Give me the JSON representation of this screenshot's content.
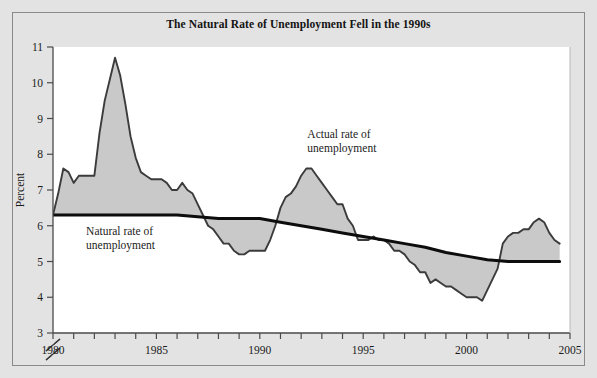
{
  "chart_data": {
    "type": "area",
    "title": "The Natural Rate of Unemployment Fell in the 1990s",
    "xlabel": "",
    "ylabel": "Percent",
    "xlim": [
      1980,
      2005
    ],
    "ylim": [
      3,
      11
    ],
    "y_axis_break": true,
    "grid": false,
    "legend_position": "inline-annotations",
    "x_ticks": [
      1980,
      1981,
      1982,
      1983,
      1984,
      1985,
      1986,
      1987,
      1988,
      1989,
      1990,
      1991,
      1992,
      1993,
      1994,
      1995,
      1996,
      1997,
      1998,
      1999,
      2000,
      2001,
      2002,
      2003,
      2004,
      2005
    ],
    "x_tick_labels": [
      "1980",
      "",
      "",
      "",
      "",
      "1985",
      "",
      "",
      "",
      "",
      "1990",
      "",
      "",
      "",
      "",
      "1995",
      "",
      "",
      "",
      "",
      "2000",
      "",
      "",
      "",
      "",
      "2005"
    ],
    "y_ticks": [
      3,
      4,
      5,
      6,
      7,
      8,
      9,
      10,
      11
    ],
    "y_tick_labels": [
      "3",
      "4",
      "5",
      "6",
      "7",
      "8",
      "9",
      "10",
      "11"
    ],
    "annotations": [
      {
        "name": "natural-rate-label",
        "text_line1": "Natural rate of",
        "text_line2": "unemployment",
        "x": 1981.6,
        "y": 5.75
      },
      {
        "name": "actual-rate-label",
        "text_line1": "Actual rate of",
        "text_line2": "unemployment",
        "x": 1992.3,
        "y": 8.45
      }
    ],
    "series": [
      {
        "name": "Actual rate of unemployment",
        "color": "#3b3b3b",
        "fill": "#c9c9c9",
        "x": [
          1980.0,
          1980.25,
          1980.5,
          1980.75,
          1981.0,
          1981.25,
          1981.5,
          1981.75,
          1982.0,
          1982.25,
          1982.5,
          1982.75,
          1983.0,
          1983.25,
          1983.5,
          1983.75,
          1984.0,
          1984.25,
          1984.5,
          1984.75,
          1985.0,
          1985.25,
          1985.5,
          1985.75,
          1986.0,
          1986.25,
          1986.5,
          1986.75,
          1987.0,
          1987.25,
          1987.5,
          1987.75,
          1988.0,
          1988.25,
          1988.5,
          1988.75,
          1989.0,
          1989.25,
          1989.5,
          1989.75,
          1990.0,
          1990.25,
          1990.5,
          1990.75,
          1991.0,
          1991.25,
          1991.5,
          1991.75,
          1992.0,
          1992.25,
          1992.5,
          1992.75,
          1993.0,
          1993.25,
          1993.5,
          1993.75,
          1994.0,
          1994.25,
          1994.5,
          1994.75,
          1995.0,
          1995.25,
          1995.5,
          1995.75,
          1996.0,
          1996.25,
          1996.5,
          1996.75,
          1997.0,
          1997.25,
          1997.5,
          1997.75,
          1998.0,
          1998.25,
          1998.5,
          1998.75,
          1999.0,
          1999.25,
          1999.5,
          1999.75,
          2000.0,
          2000.25,
          2000.5,
          2000.75,
          2001.0,
          2001.25,
          2001.5,
          2001.75,
          2002.0,
          2002.25,
          2002.5,
          2002.75,
          2003.0,
          2003.25,
          2003.5,
          2003.75,
          2004.0,
          2004.25,
          2004.5
        ],
        "y": [
          6.3,
          6.9,
          7.6,
          7.5,
          7.2,
          7.4,
          7.4,
          7.4,
          7.4,
          8.6,
          9.5,
          10.1,
          10.7,
          10.2,
          9.4,
          8.5,
          7.9,
          7.5,
          7.4,
          7.3,
          7.3,
          7.3,
          7.2,
          7.0,
          7.0,
          7.2,
          7.0,
          6.9,
          6.6,
          6.3,
          6.0,
          5.9,
          5.7,
          5.5,
          5.5,
          5.3,
          5.2,
          5.2,
          5.3,
          5.3,
          5.3,
          5.3,
          5.6,
          6.0,
          6.5,
          6.8,
          6.9,
          7.1,
          7.4,
          7.6,
          7.6,
          7.4,
          7.2,
          7.0,
          6.8,
          6.6,
          6.6,
          6.2,
          6.0,
          5.6,
          5.6,
          5.6,
          5.7,
          5.6,
          5.6,
          5.5,
          5.3,
          5.3,
          5.2,
          5.0,
          4.9,
          4.7,
          4.7,
          4.4,
          4.5,
          4.4,
          4.3,
          4.3,
          4.2,
          4.1,
          4.0,
          4.0,
          4.0,
          3.9,
          4.2,
          4.5,
          4.8,
          5.5,
          5.7,
          5.8,
          5.8,
          5.9,
          5.9,
          6.1,
          6.2,
          6.1,
          5.8,
          5.6,
          5.5
        ]
      },
      {
        "name": "Natural rate of unemployment",
        "color": "#0d0d0d",
        "x": [
          1980.0,
          1981.0,
          1982.0,
          1983.0,
          1984.0,
          1985.0,
          1986.0,
          1987.0,
          1988.0,
          1989.0,
          1990.0,
          1991.0,
          1992.0,
          1993.0,
          1994.0,
          1995.0,
          1996.0,
          1997.0,
          1998.0,
          1999.0,
          2000.0,
          2001.0,
          2002.0,
          2003.0,
          2004.0,
          2004.5
        ],
        "y": [
          6.3,
          6.3,
          6.3,
          6.3,
          6.3,
          6.3,
          6.3,
          6.25,
          6.2,
          6.2,
          6.2,
          6.1,
          6.0,
          5.9,
          5.8,
          5.7,
          5.6,
          5.5,
          5.4,
          5.25,
          5.15,
          5.05,
          5.0,
          5.0,
          5.0,
          5.0
        ]
      }
    ]
  }
}
